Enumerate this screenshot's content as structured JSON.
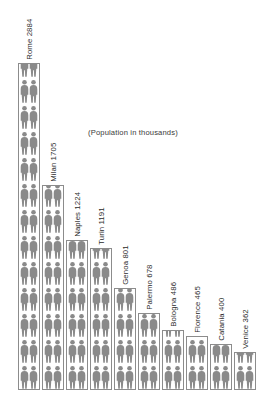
{
  "annotation": "(Population in thousands)",
  "colors": {
    "background": "#ffffff",
    "figure": "#8a8a8a",
    "bar_outline": "#8c8c8c",
    "bar_fill": "#ffffff",
    "text": "#2b2b2b"
  },
  "labels": {
    "rome": "Rome 2884",
    "milan": "Milan 1705",
    "naples": "Naples 1224",
    "turin": "Turin 1191",
    "genoa": "Genoa 801",
    "palermo": "Palermo 678",
    "bologna": "Bologna 486",
    "florence": "Florence 465",
    "catania": "Catania 400",
    "venice": "Venice 362"
  },
  "chart_data": {
    "type": "bar",
    "title": "",
    "subtitle": "",
    "annotation": "(Population in thousands)",
    "xlabel": "",
    "ylabel": "Population in thousands",
    "ylim": [
      0,
      2884
    ],
    "grid": false,
    "legend": false,
    "orientation": "vertical",
    "pictogram": true,
    "label_rotation": -90,
    "categories": [
      "Rome",
      "Milan",
      "Naples",
      "Turin",
      "Genoa",
      "Palermo",
      "Bologna",
      "Florence",
      "Catania",
      "Venice"
    ],
    "values": [
      2884,
      1705,
      1224,
      1191,
      801,
      678,
      486,
      465,
      400,
      362
    ],
    "point_labels": [
      "Rome 2884",
      "Milan 1705",
      "Naples 1224",
      "Turin 1191",
      "Genoa 801",
      "Palermo 678",
      "Bologna 486",
      "Florence 465",
      "Catania 400",
      "Venice 362"
    ],
    "bars": [
      {
        "name": "Rome",
        "value": 2884,
        "label": "Rome 2884",
        "height_px": 327,
        "left_px": 18,
        "width_px": 22
      },
      {
        "name": "Milan",
        "value": 1705,
        "label": "Milan 1705",
        "height_px": 205,
        "left_px": 42,
        "width_px": 22
      },
      {
        "name": "Naples",
        "value": 1224,
        "label": "Naples 1224",
        "height_px": 150,
        "left_px": 66,
        "width_px": 22
      },
      {
        "name": "Turin",
        "value": 1191,
        "label": "Turin 1191",
        "height_px": 142,
        "left_px": 90,
        "width_px": 22
      },
      {
        "name": "Genoa",
        "value": 801,
        "label": "Genoa 801",
        "height_px": 102,
        "left_px": 114,
        "width_px": 22
      },
      {
        "name": "Palermo",
        "value": 678,
        "label": "Palermo 678",
        "height_px": 77,
        "left_px": 138,
        "width_px": 22
      },
      {
        "name": "Bologna",
        "value": 486,
        "label": "Bologna 486",
        "height_px": 60,
        "left_px": 162,
        "width_px": 22
      },
      {
        "name": "Florence",
        "value": 465,
        "label": "Florence 465",
        "height_px": 54,
        "left_px": 186,
        "width_px": 22
      },
      {
        "name": "Catania",
        "value": 400,
        "label": "Catania 400",
        "height_px": 46,
        "left_px": 210,
        "width_px": 22
      },
      {
        "name": "Venice",
        "value": 362,
        "label": "Venice 362",
        "height_px": 38,
        "left_px": 234,
        "width_px": 22
      }
    ]
  }
}
